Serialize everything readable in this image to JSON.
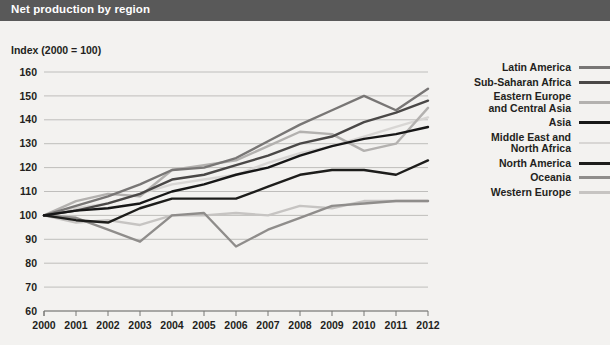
{
  "header": {
    "title": "Net production by region"
  },
  "axis_label": "Index (2000 = 100)",
  "chart_data": {
    "type": "line",
    "title": "Net production by region",
    "xlabel": "",
    "ylabel": "Index (2000 = 100)",
    "ylim": [
      60,
      160
    ],
    "ytick_step": 10,
    "yticks": [
      160,
      150,
      140,
      130,
      120,
      110,
      100,
      90,
      80,
      70,
      60
    ],
    "grid": true,
    "legend_position": "right",
    "categories": [
      "2000",
      "2001",
      "2002",
      "2003",
      "2004",
      "2005",
      "2006",
      "2007",
      "2008",
      "2009",
      "2010",
      "2011",
      "2012"
    ],
    "x": [
      2000,
      2001,
      2002,
      2003,
      2004,
      2005,
      2006,
      2007,
      2008,
      2009,
      2010,
      2011,
      2012
    ],
    "series": [
      {
        "name": "Latin America",
        "color": "#787675",
        "width": 2.4,
        "values": [
          100,
          104,
          108,
          113,
          119,
          120,
          124,
          131,
          138,
          144,
          150,
          144,
          153
        ]
      },
      {
        "name": "Sub-Saharan Africa",
        "color": "#4a4847",
        "width": 2.4,
        "values": [
          100,
          102,
          105,
          109,
          115,
          117,
          121,
          125,
          130,
          133,
          139,
          143,
          148
        ]
      },
      {
        "name": "Eastern Europe and Central Asia",
        "color": "#b3b1af",
        "width": 2.4,
        "values": [
          100,
          106,
          109,
          108,
          119,
          121,
          123,
          129,
          135,
          134,
          127,
          130,
          145
        ]
      },
      {
        "name": "Asia",
        "color": "#171717",
        "width": 2.4,
        "values": [
          100,
          102,
          103,
          105,
          110,
          113,
          117,
          120,
          125,
          129,
          132,
          134,
          137
        ]
      },
      {
        "name": "Middle East and North Africa",
        "color": "#d8d6d4",
        "width": 2.4,
        "values": [
          100,
          103,
          105,
          109,
          113,
          115,
          117,
          122,
          126,
          129,
          133,
          137,
          141
        ]
      },
      {
        "name": "North America",
        "color": "#1d1d1b",
        "width": 2.4,
        "values": [
          100,
          98,
          97,
          103,
          107,
          107,
          107,
          112,
          117,
          119,
          119,
          117,
          123
        ]
      },
      {
        "name": "Oceania",
        "color": "#8f8d8b",
        "width": 2.4,
        "values": [
          100,
          99,
          94,
          89,
          100,
          101,
          87,
          94,
          99,
          104,
          105,
          106,
          106
        ]
      },
      {
        "name": "Western Europe",
        "color": "#c6c4c2",
        "width": 2.4,
        "values": [
          100,
          97,
          98,
          96,
          100,
          100,
          101,
          100,
          104,
          103,
          106,
          106,
          106
        ]
      }
    ]
  },
  "legend": [
    {
      "label": "Latin America",
      "color": "#787675"
    },
    {
      "label": "Sub-Saharan Africa",
      "color": "#4a4847"
    },
    {
      "label": "Eastern Europe\nand Central Asia",
      "color": "#b3b1af"
    },
    {
      "label": "Asia",
      "color": "#171717"
    },
    {
      "label": "Middle East and\nNorth Africa",
      "color": "#d8d6d4"
    },
    {
      "label": "North America",
      "color": "#1d1d1b"
    },
    {
      "label": "Oceania",
      "color": "#8f8d8b"
    },
    {
      "label": "Western Europe",
      "color": "#c6c4c2"
    }
  ]
}
